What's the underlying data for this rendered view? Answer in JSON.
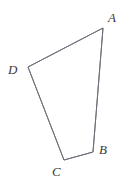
{
  "figure": {
    "name": "quadrilateral-abcd",
    "type": "geometric-diagram",
    "shape": "quadrilateral",
    "background_color": "#ffffff",
    "stroke_color": "#70707a",
    "stroke_width": 1,
    "label_color": "#3a3a3a",
    "canvas": {
      "width": 125,
      "height": 183
    }
  },
  "vertices": [
    {
      "id": "A",
      "label": "A",
      "x": 103,
      "y": 28,
      "label_x": 108,
      "label_y": 22
    },
    {
      "id": "B",
      "label": "B",
      "x": 93,
      "y": 152,
      "label_x": 99,
      "label_y": 154
    },
    {
      "id": "C",
      "label": "C",
      "x": 64,
      "y": 160,
      "label_x": 52,
      "label_y": 176
    },
    {
      "id": "D",
      "label": "D",
      "x": 28,
      "y": 67,
      "label_x": 8,
      "label_y": 74
    }
  ],
  "edges": [
    {
      "id": "AB",
      "from": "A",
      "to": "B"
    },
    {
      "id": "BC",
      "from": "B",
      "to": "C"
    },
    {
      "id": "CD",
      "from": "C",
      "to": "D"
    },
    {
      "id": "DA",
      "from": "D",
      "to": "A"
    }
  ],
  "polygon_points": "103,28 93,152 64,160 28,67"
}
